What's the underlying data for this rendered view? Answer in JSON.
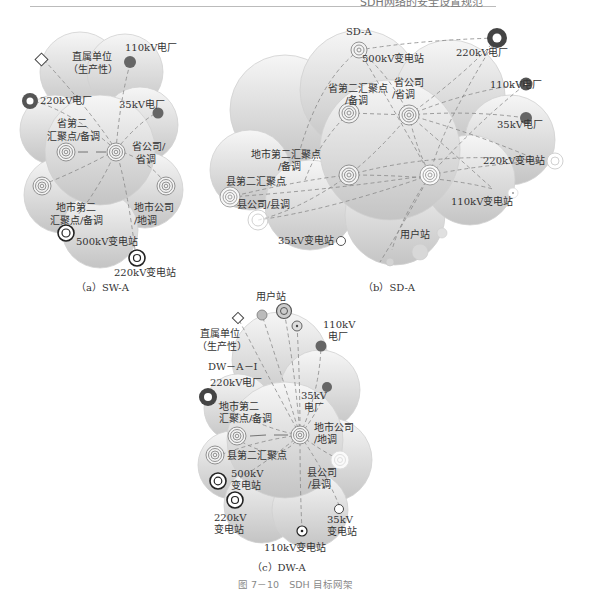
{
  "header": {
    "running_title": "SDH网络的安全设置规范"
  },
  "figure": {
    "caption": "图 7－10　SDH 目标网架"
  },
  "panels": {
    "a": {
      "caption": "（a）SW-A",
      "nodes": {
        "direct_unit": "直属单位\n（生产性）",
        "plant_110": "110kV电厂",
        "plant_220": "220kV电厂",
        "plant_35": "35kV电厂",
        "prov_second": "省第二\n汇聚点/备调",
        "prov_company": "省公司/\n省调",
        "city_second": "地市第二\n汇聚点/备调",
        "city_company": "地市公司\n/地调",
        "sub_500": "500kV变电站",
        "sub_220": "220kV变电站"
      }
    },
    "b": {
      "caption": "（b）SD-A",
      "title": "SD-A",
      "nodes": {
        "sub_500": "500kV变电站",
        "plant_220": "220kV电厂",
        "plant_110": "110kV电厂",
        "plant_35": "35kV电厂",
        "prov_second": "省第二汇聚点\n/备调",
        "prov_company": "省公司\n/省调",
        "city_second": "地市第二汇聚点\n/备调",
        "county_second": "县第二汇聚点",
        "county_company": "县公司/县调",
        "sub_220": "220kV变电站",
        "sub_110": "110kV变电站",
        "sub_35": "35kV变电站",
        "user_station": "用户站"
      }
    },
    "c": {
      "caption": "（c）DW-A",
      "subtitle": "DW－A－Ⅰ",
      "nodes": {
        "user_station": "用户站",
        "direct_unit": "直属单位\n（生产性）",
        "plant_110": "110kV\n电厂",
        "plant_220": "220kV电厂",
        "plant_35": "35kV\n电厂",
        "city_second": "地市第二\n汇聚点/备调",
        "city_company": "地市公司\n/地调",
        "county_second": "县第二汇聚点",
        "county_company": "县公司\n/县调",
        "sub_500": "500kV\n变电站",
        "sub_220": "220kV\n变电站",
        "sub_35": "35kV\n变电站",
        "sub_110": "110kV变电站"
      }
    }
  },
  "colors": {
    "cloud_fill_top": "#f4f4f4",
    "cloud_fill_bottom": "#c8c8c8",
    "cloud_stroke": "#cfcfcf",
    "plant_dark": "#555555",
    "text": "#333333",
    "caption_gray": "#888888"
  }
}
